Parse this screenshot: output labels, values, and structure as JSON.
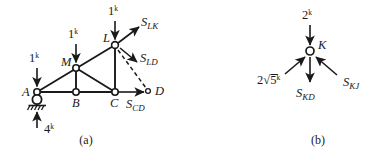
{
  "figure": {
    "captions": [
      {
        "key": "a",
        "text": "(a)"
      },
      {
        "key": "b",
        "text": "(b)"
      }
    ],
    "stroke_color": "#1a1a1a",
    "background_color": "#ffffff"
  },
  "panel_a": {
    "caption": "(a)",
    "joints": [
      {
        "name": "A",
        "label": "A",
        "x": 37,
        "y": 92,
        "support": "pin"
      },
      {
        "name": "B",
        "label": "B",
        "x": 76,
        "y": 92,
        "support": "none"
      },
      {
        "name": "C",
        "label": "C",
        "x": 115,
        "y": 92,
        "support": "none"
      },
      {
        "name": "M",
        "label": "M",
        "x": 76,
        "y": 68,
        "support": "none"
      },
      {
        "name": "L",
        "label": "L",
        "x": 115,
        "y": 45,
        "support": "none"
      },
      {
        "name": "D",
        "label": "D",
        "x": 148,
        "y": 91,
        "support": "cut"
      }
    ],
    "members": [
      {
        "from": "A",
        "to": "B"
      },
      {
        "from": "B",
        "to": "C"
      },
      {
        "from": "A",
        "to": "M"
      },
      {
        "from": "M",
        "to": "L"
      },
      {
        "from": "M",
        "to": "B"
      },
      {
        "from": "M",
        "to": "C"
      },
      {
        "from": "L",
        "to": "C"
      }
    ],
    "cut_line": {
      "from": "L",
      "to": "D",
      "style": "dashed"
    },
    "applied_loads": [
      {
        "name": "load-at-A",
        "label": "1",
        "exponent": "k",
        "direction": "down",
        "at": "A"
      },
      {
        "name": "load-at-M",
        "label": "1",
        "exponent": "k",
        "direction": "down",
        "at": "M"
      },
      {
        "name": "load-at-L",
        "label": "1",
        "exponent": "k",
        "direction": "down",
        "at": "L"
      }
    ],
    "reaction": {
      "name": "reaction-at-A",
      "label": "4",
      "exponent": "k",
      "direction": "up",
      "at": "A"
    },
    "member_forces": [
      {
        "name": "force-SLK",
        "base": "S",
        "sub": "LK",
        "at": "L",
        "direction": "up-right"
      },
      {
        "name": "force-SLD",
        "base": "S",
        "sub": "LD",
        "at": "L",
        "direction": "down-right"
      },
      {
        "name": "force-SCD",
        "base": "S",
        "sub": "CD",
        "at": "C",
        "direction": "right"
      }
    ]
  },
  "panel_b": {
    "caption": "(b)",
    "joint": {
      "name": "K",
      "label": "K",
      "x": 310,
      "y": 51
    },
    "applied_load": {
      "name": "load-at-K",
      "label": "2",
      "exponent": "k",
      "direction": "down"
    },
    "member_forces": [
      {
        "name": "force-2root5",
        "base": "2",
        "radical": "5",
        "exponent": "k",
        "direction": "up-right-incoming"
      },
      {
        "name": "force-SKD",
        "base": "S",
        "sub": "KD",
        "direction": "down"
      },
      {
        "name": "force-SKJ",
        "base": "S",
        "sub": "KJ",
        "direction": "up-left-incoming"
      }
    ]
  }
}
